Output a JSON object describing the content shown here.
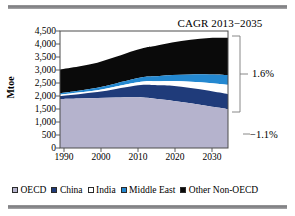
{
  "figure": {
    "title": "CAGR 2013−2035",
    "rules": [
      "top-rule",
      "bottom-rule"
    ]
  },
  "axes": {
    "ylabel": "Mtoe",
    "yticks": [
      "4,500",
      "4,000",
      "3,500",
      "3,000",
      "2,500",
      "2,000",
      "1,500",
      "1,000",
      "500",
      "0"
    ],
    "xticks": [
      "1990",
      "2000",
      "2010",
      "2020",
      "2030"
    ]
  },
  "annotations": {
    "non_oecd_cagr": "1.6%",
    "oecd_cagr": "−1.1%"
  },
  "legend": {
    "items": [
      {
        "label": "OECD",
        "color": "#b5b3cd"
      },
      {
        "label": "China",
        "color": "#1f3b7a"
      },
      {
        "label": "India",
        "color": "#ffffff"
      },
      {
        "label": "Middle East",
        "color": "#2488d0"
      },
      {
        "label": "Other Non-OECD",
        "color": "#0a0a0a"
      }
    ]
  },
  "chart_data": {
    "type": "area",
    "title": "CAGR 2013−2035",
    "xlabel": "",
    "ylabel": "Mtoe",
    "ylim": [
      0,
      4500
    ],
    "xlim": [
      1990,
      2035
    ],
    "grid": false,
    "legend_position": "bottom",
    "stacked": true,
    "x": [
      1990,
      1995,
      2000,
      2005,
      2010,
      2013,
      2015,
      2020,
      2025,
      2030,
      2035
    ],
    "series": [
      {
        "name": "OECD",
        "color": "#b5b3cd",
        "values": [
          1880,
          1900,
          1920,
          1940,
          1950,
          1930,
          1900,
          1820,
          1720,
          1610,
          1500
        ]
      },
      {
        "name": "China",
        "color": "#1f3b7a",
        "values": [
          120,
          170,
          230,
          330,
          440,
          500,
          520,
          570,
          590,
          590,
          570
        ]
      },
      {
        "name": "India",
        "color": "#ffffff",
        "values": [
          50,
          60,
          75,
          95,
          120,
          140,
          150,
          190,
          240,
          300,
          360
        ]
      },
      {
        "name": "Middle East",
        "color": "#2488d0",
        "values": [
          60,
          75,
          95,
          120,
          150,
          170,
          185,
          230,
          280,
          330,
          380
        ]
      },
      {
        "name": "Other Non-OECD",
        "color": "#0a0a0a",
        "values": [
          910,
          930,
          960,
          1020,
          1090,
          1130,
          1160,
          1250,
          1330,
          1400,
          1430
        ]
      }
    ],
    "totals": [
      3020,
      3135,
      3280,
      3505,
      3750,
      3870,
      3915,
      4060,
      4160,
      4230,
      4240
    ],
    "annotations": [
      {
        "text": "1.6%",
        "refers_to": "non-OECD aggregate",
        "value": 1.6
      },
      {
        "text": "−1.1%",
        "refers_to": "OECD",
        "value": -1.1
      }
    ]
  }
}
